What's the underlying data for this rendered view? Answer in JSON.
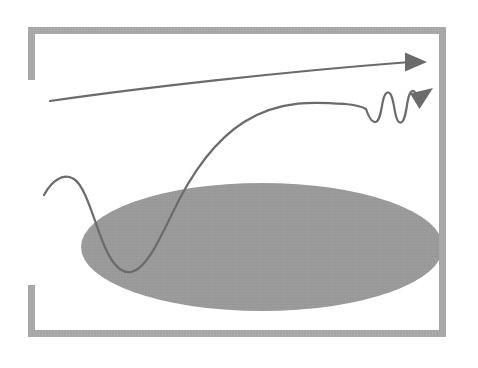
{
  "figure": {
    "kind": "line-diagram",
    "caption_artifact": "",
    "background_color": "#ffffff",
    "width": 478,
    "height": 368
  },
  "colors": {
    "frame_gray": "#a6a6a6",
    "frame_gray_light": "#b4b4b4",
    "ellipse_gray": "#9a9a9a",
    "curve_gray": "#6b6b6b",
    "arrow_gray": "#6b6b6b",
    "background": "#ffffff",
    "ghost_text": "#43424a"
  },
  "frame": {
    "name": "broken-rectangle-frame",
    "stroke_width": 7,
    "left": 28,
    "top": 27,
    "right": 446,
    "bottom": 337,
    "segments": [
      {
        "name": "top-edge",
        "x1": 28,
        "y1": 30.5,
        "x2": 446,
        "y2": 30.5,
        "continuous": true
      },
      {
        "name": "right-edge",
        "x1": 442.5,
        "y1": 27,
        "x2": 442.5,
        "y2": 337,
        "continuous": true
      },
      {
        "name": "bottom-edge",
        "x1": 28,
        "y1": 333.5,
        "x2": 446,
        "y2": 333.5,
        "continuous": true
      },
      {
        "name": "left-edge-upper-stub",
        "x1": 31.5,
        "y1": 27,
        "x2": 31.5,
        "y2": 80,
        "continuous": false
      },
      {
        "name": "left-edge-lower-stub",
        "x1": 31.5,
        "y1": 285,
        "x2": 31.5,
        "y2": 337,
        "continuous": false
      }
    ],
    "left_gap": {
      "from_y": 80,
      "to_y": 285
    }
  },
  "ellipse": {
    "name": "shaded-ellipse",
    "center_x": 262,
    "center_y": 247,
    "radius_x": 181,
    "radius_y": 64,
    "fill": "#9a9a9a",
    "clipped_right_at_x": 443,
    "left_extent": 81,
    "top_extent": 183,
    "bottom_extent": 311
  },
  "arrows": [
    {
      "name": "upper-smooth-arrow",
      "label": "",
      "style": "smooth-arc",
      "stroke": "#6b6b6b",
      "stroke_width": 2.2,
      "start": [
        50,
        101
      ],
      "end": [
        410,
        62
      ],
      "head_tip": [
        427,
        62
      ],
      "head_angle_deg": 0,
      "head_type": "solid-triangle",
      "head_length": 19,
      "head_width": 16,
      "path": "M 50,101 C 140,88 280,72 410,62"
    },
    {
      "name": "lower-wavy-arrow",
      "label": "",
      "style": "s-curve-then-oscillation",
      "stroke": "#6b6b6b",
      "stroke_width": 2.2,
      "start": [
        44,
        195
      ],
      "local_peak": [
        72,
        177
      ],
      "trough": [
        130,
        272
      ],
      "plateau_y": 105,
      "oscillation_cycles": 3,
      "oscillation_start_x": 366,
      "oscillation_end_x": 415,
      "oscillation_amplitude": 14,
      "head_tip": [
        433,
        90
      ],
      "head_angle_deg": -41,
      "head_type": "solid-triangle",
      "head_length": 20,
      "head_width": 15,
      "path": "M 44,195 C 52,180 64,173 74,179 C 86,186 92,214 102,240 C 110,262 120,274 131,272 C 145,269 157,245 172,214 C 190,177 214,141 244,122 C 280,100 318,102 344,104 C 356,105 362,106 366,108"
    }
  ],
  "ghost_artifact": {
    "name": "scan-ghost-text",
    "visible": true,
    "text": "                                                        "
  }
}
